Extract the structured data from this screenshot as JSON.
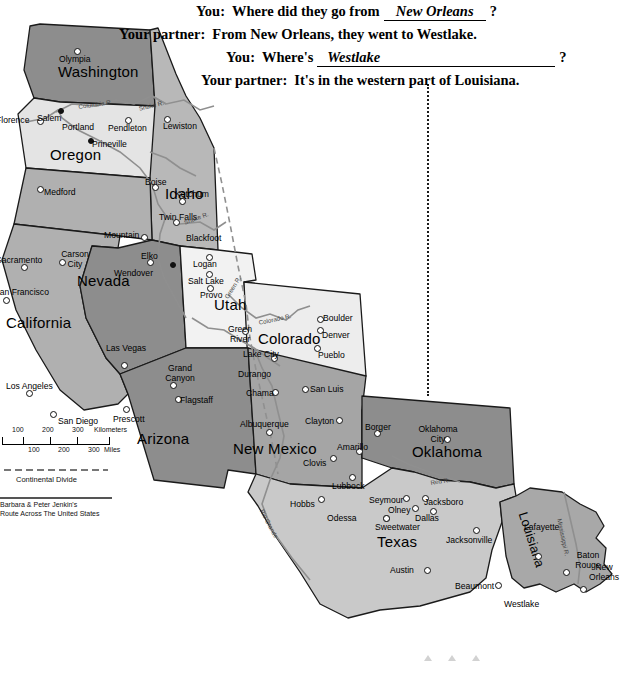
{
  "dialogue": {
    "lines": [
      {
        "speaker": "You:",
        "pre": "Where did they go from",
        "blank": "New Orleans",
        "post": "?"
      },
      {
        "speaker": "Your partner:",
        "pre": "From New Orleans, they went to Westlake.",
        "blank": "",
        "post": ""
      },
      {
        "speaker": "You:",
        "pre": "Where's",
        "blank": "Westlake",
        "post": "?"
      },
      {
        "speaker": "Your partner:",
        "pre": "It's in the western part of Louisiana.",
        "blank": "",
        "post": ""
      }
    ]
  },
  "legend": {
    "scale_km_ticks": [
      "100",
      "200",
      "300"
    ],
    "scale_km_unit": "Kilometers",
    "scale_mi_ticks": [
      "100",
      "200",
      "300"
    ],
    "scale_mi_unit": "Miles",
    "continental_divide": "Continental Divide",
    "credit_line1": "Barbara & Peter Jenkin's",
    "credit_line2": "Route Across The United States"
  },
  "map": {
    "states": [
      {
        "name": "Washington",
        "x": 58,
        "y": 45,
        "size": "lg"
      },
      {
        "name": "Oregon",
        "x": 50,
        "y": 128,
        "size": "lg"
      },
      {
        "name": "Idaho",
        "x": 165,
        "y": 167,
        "size": "lg"
      },
      {
        "name": "Nevada",
        "x": 77,
        "y": 254,
        "size": "lg"
      },
      {
        "name": "California",
        "x": 6,
        "y": 296,
        "size": "lg"
      },
      {
        "name": "Utah",
        "x": 214,
        "y": 278,
        "size": "lg"
      },
      {
        "name": "Colorado",
        "x": 258,
        "y": 312,
        "size": "lg"
      },
      {
        "name": "Arizona",
        "x": 137,
        "y": 412,
        "size": "lg"
      },
      {
        "name": "New Mexico",
        "x": 233,
        "y": 422,
        "size": "lg"
      },
      {
        "name": "Oklahoma",
        "x": 412,
        "y": 425,
        "size": "lg"
      },
      {
        "name": "Texas",
        "x": 377,
        "y": 515,
        "size": "lg"
      },
      {
        "name": "Louisiana",
        "x": 530,
        "y": 492,
        "size": "rot"
      }
    ],
    "cities": [
      {
        "name": "Olympia",
        "lx": 59,
        "ly": 36,
        "dx": 74,
        "dy": 30,
        "dot": "open"
      },
      {
        "name": "Florence",
        "lx": -4,
        "ly": 97,
        "dx": 37,
        "dy": 100,
        "dot": "open"
      },
      {
        "name": "Salem",
        "lx": 37,
        "ly": 95,
        "dx": 58,
        "dy": 90,
        "dot": "solid"
      },
      {
        "name": "Portland",
        "lx": 62,
        "ly": 104,
        "dx": 55,
        "dy": 100,
        "dot": "none"
      },
      {
        "name": "Pendleton",
        "lx": 108,
        "ly": 105,
        "dx": 125,
        "dy": 99,
        "dot": "open"
      },
      {
        "name": "Lewiston",
        "lx": 163,
        "ly": 103,
        "dx": 164,
        "dy": 98,
        "dot": "open"
      },
      {
        "name": "Prineville",
        "lx": 92,
        "ly": 121,
        "dx": 88,
        "dy": 120,
        "dot": "solid"
      },
      {
        "name": "Medford",
        "lx": 44,
        "ly": 169,
        "dx": 37,
        "dy": 168,
        "dot": "open"
      },
      {
        "name": "Boise",
        "lx": 145,
        "ly": 159,
        "dx": 152,
        "dy": 166,
        "dot": "open"
      },
      {
        "name": "Ketchum",
        "lx": 175,
        "ly": 171,
        "dx": 179,
        "dy": 180,
        "dot": "open"
      },
      {
        "name": "Twin Falls",
        "lx": 157,
        "ly": 195,
        "dx": 173,
        "dy": 201,
        "dot": "open"
      },
      {
        "name": "Blackfoot",
        "lx": 186,
        "ly": 215,
        "dx": 192,
        "dy": 209,
        "dot": "none"
      },
      {
        "name": "Mountain",
        "lx": 104,
        "ly": 212,
        "dx": 141,
        "dy": 216,
        "dot": "open"
      },
      {
        "name": "Elko",
        "lx": 141,
        "ly": 233,
        "dx": 147,
        "dy": 241,
        "dot": "open"
      },
      {
        "name": "Wendover",
        "lx": 114,
        "ly": 250,
        "dx": 170,
        "dy": 244,
        "dot": "solid"
      },
      {
        "name": "Sacramento",
        "lx": -4,
        "ly": 237,
        "dx": 21,
        "dy": 246,
        "dot": "open"
      },
      {
        "name": "Carson City",
        "lx": 54,
        "ly": 232,
        "dx": 59,
        "dy": 241,
        "dot": "open"
      },
      {
        "name": "Logan",
        "lx": 193,
        "ly": 241,
        "dx": 206,
        "dy": 236,
        "dot": "open"
      },
      {
        "name": "Salt Lake",
        "lx": 188,
        "ly": 258,
        "dx": 206,
        "dy": 253,
        "dot": "open"
      },
      {
        "name": "Provo",
        "lx": 200,
        "ly": 272,
        "dx": 207,
        "dy": 267,
        "dot": "open"
      },
      {
        "name": "San Francisco",
        "lx": -6,
        "ly": 269,
        "dx": 3,
        "dy": 279,
        "dot": "open"
      },
      {
        "name": "Green River",
        "lx": 219,
        "ly": 307,
        "dx": 242,
        "dy": 310,
        "dot": "open"
      },
      {
        "name": "Boulder",
        "lx": 323,
        "ly": 295,
        "dx": 317,
        "dy": 298,
        "dot": "open"
      },
      {
        "name": "Denver",
        "lx": 322,
        "ly": 312,
        "dx": 317,
        "dy": 309,
        "dot": "open"
      },
      {
        "name": "Pueblo",
        "lx": 318,
        "ly": 332,
        "dx": 314,
        "dy": 327,
        "dot": "open"
      },
      {
        "name": "Lake City",
        "lx": 243,
        "ly": 331,
        "dx": 271,
        "dy": 337,
        "dot": "open"
      },
      {
        "name": "Las Vegas",
        "lx": 106,
        "ly": 325,
        "dx": 121,
        "dy": 344,
        "dot": "open"
      },
      {
        "name": "Durango",
        "lx": 238,
        "ly": 351,
        "dx": 270,
        "dy": 349,
        "dot": "none"
      },
      {
        "name": "Grand Canyon",
        "lx": 159,
        "ly": 346,
        "dx": 170,
        "dy": 364,
        "dot": "open"
      },
      {
        "name": "Los Angeles",
        "lx": 6,
        "ly": 363,
        "dx": 26,
        "dy": 372,
        "dot": "open"
      },
      {
        "name": "Flagstaff",
        "lx": 180,
        "ly": 377,
        "dx": 175,
        "dy": 378,
        "dot": "open"
      },
      {
        "name": "Chama",
        "lx": 246,
        "ly": 370,
        "dx": 272,
        "dy": 371,
        "dot": "open"
      },
      {
        "name": "San Luis",
        "lx": 310,
        "ly": 366,
        "dx": 302,
        "dy": 368,
        "dot": "open"
      },
      {
        "name": "Prescott",
        "lx": 113,
        "ly": 396,
        "dx": 123,
        "dy": 388,
        "dot": "open"
      },
      {
        "name": "San Diego",
        "lx": 58,
        "ly": 398,
        "dx": 50,
        "dy": 393,
        "dot": "open"
      },
      {
        "name": "Clayton",
        "lx": 305,
        "ly": 398,
        "dx": 336,
        "dy": 399,
        "dot": "open"
      },
      {
        "name": "Borger",
        "lx": 365,
        "ly": 404,
        "dx": 374,
        "dy": 412,
        "dot": "open"
      },
      {
        "name": "Oklahoma City",
        "lx": 417,
        "ly": 407,
        "dx": 444,
        "dy": 418,
        "dot": "open"
      },
      {
        "name": "Albuquerque",
        "lx": 240,
        "ly": 401,
        "dx": 266,
        "dy": 411,
        "dot": "open"
      },
      {
        "name": "Amarillo",
        "lx": 337,
        "ly": 424,
        "dx": 356,
        "dy": 430,
        "dot": "open"
      },
      {
        "name": "Clovis",
        "lx": 303,
        "ly": 440,
        "dx": 330,
        "dy": 437,
        "dot": "open"
      },
      {
        "name": "Lubbock",
        "lx": 332,
        "ly": 463,
        "dx": 349,
        "dy": 456,
        "dot": "open"
      },
      {
        "name": "Hobbs",
        "lx": 290,
        "ly": 481,
        "dx": 318,
        "dy": 478,
        "dot": "open"
      },
      {
        "name": "Seymour",
        "lx": 369,
        "ly": 477,
        "dx": 403,
        "dy": 477,
        "dot": "open"
      },
      {
        "name": "Jacksboro",
        "lx": 424,
        "ly": 479,
        "dx": 422,
        "dy": 477,
        "dot": "open"
      },
      {
        "name": "Olney",
        "lx": 388,
        "ly": 487,
        "dx": 412,
        "dy": 487,
        "dot": "open"
      },
      {
        "name": "Dallas",
        "lx": 415,
        "ly": 495,
        "dx": 430,
        "dy": 490,
        "dot": "open"
      },
      {
        "name": "Odessa",
        "lx": 327,
        "ly": 495,
        "dx": 383,
        "dy": 497,
        "dot": "open"
      },
      {
        "name": "Sweetwater",
        "lx": 375,
        "ly": 504,
        "dx": 383,
        "dy": 497,
        "dot": "open"
      },
      {
        "name": "Jacksonville",
        "lx": 446,
        "ly": 517,
        "dx": 473,
        "dy": 509,
        "dot": "open"
      },
      {
        "name": "Lafayette",
        "lx": 524,
        "ly": 504,
        "dx": 535,
        "dy": 535,
        "dot": "open"
      },
      {
        "name": "Baton Rouge",
        "lx": 567,
        "ly": 533,
        "dx": 563,
        "dy": 551,
        "dot": "open"
      },
      {
        "name": "New Orleans",
        "lx": 583,
        "ly": 545,
        "dx": 580,
        "dy": 568,
        "dot": "open"
      },
      {
        "name": "Austin",
        "lx": 390,
        "ly": 547,
        "dx": 424,
        "dy": 549,
        "dot": "open"
      },
      {
        "name": "Beaumont",
        "lx": 455,
        "ly": 563,
        "dx": 495,
        "dy": 564,
        "dot": "open"
      },
      {
        "name": "Westlake",
        "lx": 504,
        "ly": 581,
        "dx": 513,
        "dy": 560,
        "dot": "none"
      }
    ],
    "rivers": [
      {
        "name": "Columbia R.",
        "x": 78,
        "y": 85,
        "rot": -8
      },
      {
        "name": "Snake R.",
        "x": 138,
        "y": 87,
        "rot": -14
      },
      {
        "name": "Snake R.",
        "x": 183,
        "y": 201,
        "rot": -20
      },
      {
        "name": "Green R.",
        "x": 223,
        "y": 278,
        "rot": -58
      },
      {
        "name": "Colorado R.",
        "x": 258,
        "y": 301,
        "rot": -12
      },
      {
        "name": "Red R.",
        "x": 430,
        "y": 461,
        "rot": -9
      },
      {
        "name": "Rio Grande",
        "x": 265,
        "y": 490,
        "rot": 62
      },
      {
        "name": "Mississippi R.",
        "x": 563,
        "y": 500,
        "rot": 78
      }
    ]
  },
  "colors": {
    "washington": "#8d8d8d",
    "oregon": "#e4e4e4",
    "california": "#b0b0b0",
    "nevada": "#8d8d8d",
    "idaho": "#b8b8b8",
    "utah": "#f2f2f2",
    "colorado": "#ededed",
    "arizona": "#8d8d8d",
    "new_mexico": "#a5a5a5",
    "oklahoma": "#8d8d8d",
    "texas": "#c9c9c9",
    "louisiana": "#a8a8a8",
    "panhandle": "#d8d8d8",
    "outline": "#1a1a1a",
    "river": "#8f8f8f",
    "dotted_line": "#1a1a1a"
  }
}
